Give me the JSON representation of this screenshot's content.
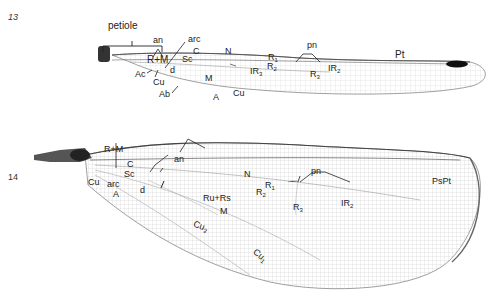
{
  "figures": [
    {
      "number": "13",
      "labels": {
        "petiole": "petiole",
        "an": "an",
        "arc": "arc",
        "C": "C",
        "Sc": "Sc",
        "N": "N",
        "RM": "R+M",
        "Ac": "Ac",
        "Cu": "Cu",
        "d": "d",
        "Ab": "Ab",
        "M": "M",
        "A": "A",
        "Cu2": "Cu",
        "pn": "pn",
        "R1": "R",
        "R1sub": "1",
        "R2": "R",
        "R2sub": "2",
        "IR3": "IR",
        "IR3sub": "3",
        "R3": "R",
        "R3sub": "3",
        "IR2": "IR",
        "IR2sub": "2",
        "Pt": "Pt"
      }
    },
    {
      "number": "14",
      "labels": {
        "RM": "R+M",
        "C": "C",
        "Sc": "Sc",
        "Cu": "Cu",
        "arc": "arc",
        "A": "A",
        "d": "d",
        "an": "an",
        "N": "N",
        "R1": "R",
        "R1sub": "1",
        "R2": "R",
        "R2sub": "2",
        "RuRs": "Ru+Rs",
        "M": "M",
        "pn": "pn",
        "R3": "R",
        "R3sub": "3",
        "IR2": "IR",
        "IR2sub": "2",
        "PsPt": "PsPt",
        "Cu2": "Cu",
        "Cu2sub": "2",
        "Cu1": "Cu",
        "Cu1sub": "1"
      }
    }
  ]
}
